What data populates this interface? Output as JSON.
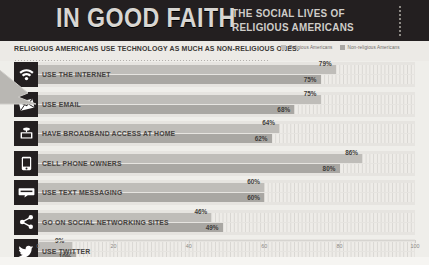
{
  "header": {
    "title": "IN GOOD FAITH",
    "subtitle_line1": "THE SOCIAL LIVES OF",
    "subtitle_line2": "RELIGIOUS AMERICANS"
  },
  "subbar": {
    "title": "RELIGIOUS AMERICANS USE TECHNOLOGY AS MUCH AS NON-RELIGIOUS ONES."
  },
  "legend": {
    "series1_label": "Religious Americans",
    "series1_color": "#bfbdb9",
    "series2_label": "Non-religious Americans",
    "series2_color": "#a9a7a3"
  },
  "icons": {
    "internet": "wifi-icon",
    "email": "envelope-icon",
    "broadband": "desktop-computer-icon",
    "cellphone": "mobile-phone-icon",
    "text": "speech-bubble-icon",
    "social": "share-network-icon",
    "twitter": "twitter-bird-icon"
  },
  "chart_data": {
    "type": "bar",
    "orientation": "horizontal",
    "title": "RELIGIOUS AMERICANS USE TECHNOLOGY AS MUCH AS NON-RELIGIOUS ONES.",
    "xlabel": "",
    "ylabel": "",
    "xlim": [
      0,
      100
    ],
    "xticks": [
      0,
      20,
      40,
      60,
      80,
      100
    ],
    "xtick_labels": [
      "0",
      "20",
      "40",
      "60",
      "80",
      "100"
    ],
    "grid": true,
    "legend_position": "top-right",
    "value_suffix": "%",
    "categories": [
      "USE THE INTERNET",
      "USE EMAIL",
      "HAVE BROADBAND ACCESS AT HOME",
      "CELL PHONE OWNERS",
      "USE TEXT MESSAGING",
      "GO ON SOCIAL NETWORKING SITES",
      "USE TWITTER"
    ],
    "series": [
      {
        "name": "Religious Americans",
        "color": "#bfbdb9",
        "values": [
          79,
          75,
          64,
          86,
          60,
          46,
          9
        ],
        "labels": [
          "79%",
          "75%",
          "64%",
          "86%",
          "60%",
          "46%",
          "9%"
        ]
      },
      {
        "name": "Non-religious Americans",
        "color": "#a9a7a3",
        "values": [
          75,
          68,
          62,
          80,
          60,
          49,
          10
        ],
        "labels": [
          "75%",
          "68%",
          "62%",
          "80%",
          "60%",
          "49%",
          "10%"
        ]
      }
    ]
  }
}
